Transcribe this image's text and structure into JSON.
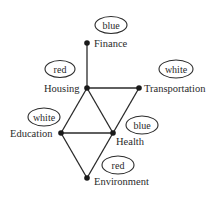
{
  "diagram": {
    "type": "graph-coloring",
    "nodes": [
      {
        "id": "finance",
        "label": "Finance",
        "x": 87,
        "y": 43,
        "color": "blue",
        "label_dx": 7,
        "label_dy": 4,
        "ellipse": {
          "cx": 111,
          "cy": 25,
          "rx": 16,
          "ry": 8.5
        }
      },
      {
        "id": "housing",
        "label": "Housing",
        "x": 87,
        "y": 88,
        "color": "red",
        "label_dx": -43,
        "label_dy": 4,
        "ellipse": {
          "cx": 60,
          "cy": 69,
          "rx": 15,
          "ry": 8.5
        }
      },
      {
        "id": "transportation",
        "label": "Transportation",
        "x": 139,
        "y": 88,
        "color": "white",
        "label_dx": 5,
        "label_dy": 4,
        "ellipse": {
          "cx": 176,
          "cy": 69,
          "rx": 17,
          "ry": 9
        }
      },
      {
        "id": "education",
        "label": "Education",
        "x": 61,
        "y": 133,
        "color": "white",
        "label_dx": -51,
        "label_dy": 4,
        "ellipse": {
          "cx": 44,
          "cy": 117,
          "rx": 16,
          "ry": 9
        }
      },
      {
        "id": "health",
        "label": "Health",
        "x": 113,
        "y": 133,
        "color": "blue",
        "label_dx": 3,
        "label_dy": 12,
        "ellipse": {
          "cx": 142,
          "cy": 125,
          "rx": 16,
          "ry": 9
        }
      },
      {
        "id": "environment",
        "label": "Environment",
        "x": 87,
        "y": 178,
        "color": "red",
        "label_dx": 7,
        "label_dy": 7,
        "ellipse": {
          "cx": 118,
          "cy": 165,
          "rx": 16,
          "ry": 9
        }
      }
    ],
    "edges": [
      [
        "finance",
        "housing"
      ],
      [
        "housing",
        "transportation"
      ],
      [
        "housing",
        "education"
      ],
      [
        "housing",
        "health"
      ],
      [
        "transportation",
        "health"
      ],
      [
        "education",
        "health"
      ],
      [
        "education",
        "environment"
      ],
      [
        "health",
        "environment"
      ]
    ]
  }
}
